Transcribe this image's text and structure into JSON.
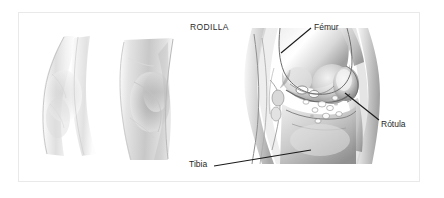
{
  "figure": {
    "title": "RODILLA",
    "frame_border_color": "#e9e9e9",
    "background_color": "#ffffff",
    "label_color": "#1f1f1f",
    "leader_line_color": "#1a1a1a"
  },
  "labels": [
    {
      "id": "femur",
      "text": "Fémur",
      "x": 314,
      "y": 22,
      "leader": {
        "x1": 311,
        "y1": 28,
        "x2": 281,
        "y2": 53
      }
    },
    {
      "id": "rotula",
      "text": "Rótula",
      "x": 381,
      "y": 119,
      "leader": {
        "x1": 379,
        "y1": 120,
        "x2": 345,
        "y2": 93
      }
    },
    {
      "id": "tibia",
      "text": "Tibia",
      "x": 189,
      "y": 159,
      "leader": {
        "x1": 214,
        "y1": 166,
        "x2": 311,
        "y2": 150
      }
    }
  ],
  "illustrations": [
    {
      "id": "sketch-leg-left",
      "alt": "pencil sketch of leg, lateral view"
    },
    {
      "id": "sketch-leg-right",
      "alt": "pencil sketch of knee, shaded view"
    },
    {
      "id": "anatomy-knee",
      "alt": "grayscale anatomical cross-section of the knee joint"
    }
  ]
}
